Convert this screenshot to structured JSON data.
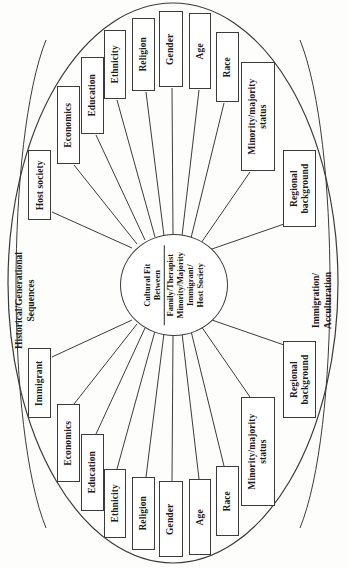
{
  "diagram": {
    "type": "radial-concept-map",
    "orientation": "rotated-90-ccw",
    "center": {
      "line1": "Cultural Fit",
      "line2": "Between",
      "line3": "Family/Therapist",
      "line4": "Minority/Majority",
      "line5": "Immigrant/",
      "line6": "Host Society"
    },
    "regions": [
      {
        "id": "historical",
        "label": "Historical/Generational Sequences",
        "line1": "Historical/Generational",
        "line2": "Sequences"
      },
      {
        "id": "immigration",
        "label": "Immigration/Acculturation",
        "line1": "Immigration/",
        "line2": "Acculturation"
      }
    ],
    "nodes_top": [
      {
        "id": "host-society",
        "label": "Host society"
      },
      {
        "id": "economics-top",
        "label": "Economics"
      },
      {
        "id": "education-top",
        "label": "Education"
      },
      {
        "id": "ethnicity-top",
        "label": "Ethnicity"
      },
      {
        "id": "religion-top",
        "label": "Religion"
      },
      {
        "id": "gender-top",
        "label": "Gender"
      },
      {
        "id": "age-top",
        "label": "Age"
      },
      {
        "id": "race-top",
        "label": "Race"
      },
      {
        "id": "minority-majority-top",
        "label": "Minority/majority status",
        "line1": "Minority/majority",
        "line2": "status"
      },
      {
        "id": "regional-background-top",
        "label": "Regional background",
        "line1": "Regional",
        "line2": "background"
      }
    ],
    "nodes_bottom": [
      {
        "id": "immigrant",
        "label": "Immigrant"
      },
      {
        "id": "economics-bottom",
        "label": "Economics"
      },
      {
        "id": "education-bottom",
        "label": "Education"
      },
      {
        "id": "ethnicity-bottom",
        "label": "Ethnicity"
      },
      {
        "id": "religion-bottom",
        "label": "Religion"
      },
      {
        "id": "gender-bottom",
        "label": "Gender"
      },
      {
        "id": "age-bottom",
        "label": "Age"
      },
      {
        "id": "race-bottom",
        "label": "Race"
      },
      {
        "id": "minority-majority-bottom",
        "label": "Minority/majority status",
        "line1": "Minority/majority",
        "line2": "status"
      },
      {
        "id": "regional-background-bottom",
        "label": "Regional",
        "line1": "Regional",
        "line2": "background"
      }
    ],
    "colors": {
      "stroke": "#3b3b3b",
      "text": "#161616",
      "background": "#ffffff"
    }
  }
}
